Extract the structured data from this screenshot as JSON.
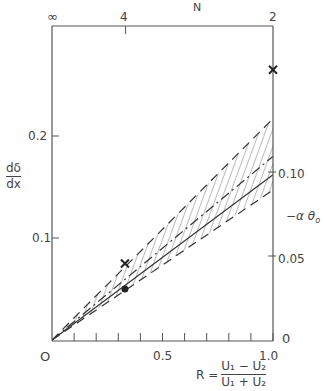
{
  "chart_data": {
    "type": "line",
    "title": "",
    "xlabel": "R = (U1 - U2)/(U1 + U2)",
    "ylabel_left": "dδ/dx",
    "ylabel_right": "-αθo",
    "xlabel_top": "N",
    "xlim": [
      0,
      1.0
    ],
    "ylim_left": [
      0,
      0.308
    ],
    "ylim_right": [
      0,
      0.205
    ],
    "grid": false,
    "legend": "none",
    "x_ticks": [
      0,
      0.1,
      0.2,
      0.3,
      0.4,
      0.5,
      0.6,
      0.7,
      0.8,
      0.9,
      1.0
    ],
    "x_tick_labels": [
      {
        "value": 0,
        "label": "O"
      },
      {
        "value": 0.5,
        "label": "0.5"
      },
      {
        "value": 1.0,
        "label": "1.0"
      }
    ],
    "y_left_ticks": [
      {
        "value": 0.1,
        "label": "0.1"
      },
      {
        "value": 0.2,
        "label": "0.2"
      }
    ],
    "y_right_ticks": [
      {
        "value": 0,
        "label": "0"
      },
      {
        "value": 0.05,
        "label": "0.05"
      },
      {
        "value": 0.1,
        "label": "0.10"
      }
    ],
    "x_top_ticks": [
      {
        "value": 0,
        "label": "∞"
      },
      {
        "value": 0.333,
        "label": "4"
      },
      {
        "value": 1.0,
        "label": "2"
      }
    ],
    "series": [
      {
        "name": "upper dashed bound",
        "style": "dashed",
        "x": [
          0,
          1.0
        ],
        "y": [
          0,
          0.217
        ]
      },
      {
        "name": "dash-dot line",
        "style": "dashdot",
        "x": [
          0,
          1.0
        ],
        "y": [
          0,
          0.18
        ]
      },
      {
        "name": "solid line",
        "style": "solid",
        "x": [
          0,
          1.0
        ],
        "y": [
          0,
          0.162
        ]
      },
      {
        "name": "lower dashed bound",
        "style": "dashed",
        "x": [
          0,
          1.0
        ],
        "y": [
          0,
          0.147
        ]
      }
    ],
    "shaded_region": {
      "between": [
        "upper dashed bound",
        "lower dashed bound"
      ],
      "pattern": "diagonal hatching"
    },
    "points": [
      {
        "marker": "x",
        "x": 0.33,
        "y": 0.075
      },
      {
        "marker": "filled-circle",
        "x": 0.33,
        "y": 0.05
      },
      {
        "marker": "x",
        "x": 1.0,
        "y": 0.265
      }
    ]
  },
  "labels": {
    "top_axis_title": "N",
    "top_inf": "∞",
    "top_4": "4",
    "top_2": "2",
    "left_num": "dδ",
    "left_den": "dx",
    "left_02": "0.2",
    "left_01": "0.1",
    "right_010": "0.10",
    "right_005": "0.05",
    "right_0": "0",
    "right_title": "−α θ",
    "right_title_sub": "o",
    "x_0": "O",
    "x_05": "0.5",
    "x_10": "1.0",
    "r_prefix": "R =",
    "r_num": "U₁ − U₂",
    "r_den": "U₁ + U₂"
  },
  "colors": {
    "ink": "#333333",
    "axis": "#555555",
    "hatch": "#555555"
  }
}
